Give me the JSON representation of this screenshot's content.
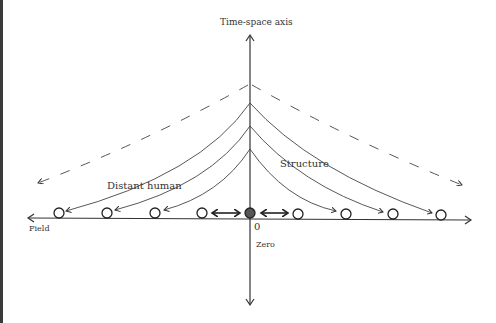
{
  "diagram": {
    "labels": {
      "vertical_axis": "Time-space axis",
      "horizontal_axis": "Field",
      "origin_value": "0",
      "origin_name": "Zero",
      "right_curve_group": "Structure",
      "left_curve_group": "Distant human"
    },
    "colors": {
      "line": "#333333",
      "text": "#333333",
      "origin_fill": "#555555",
      "background": "#ffffff",
      "left_border": "#3a3a3a"
    },
    "nodes": {
      "origin": "filled circle at zero",
      "left_count": 4,
      "right_count": 4
    },
    "arrows": {
      "near_origin": "double-headed bold arrows between origin and nearest circles",
      "curves": "solid curved arrows from axis to circles",
      "outer": "dashed curves pointing outward"
    }
  }
}
